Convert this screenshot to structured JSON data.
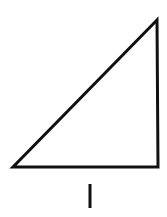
{
  "diagram": {
    "shape": "right-triangle",
    "stroke_color": "#111111",
    "background": "#ffffff",
    "vertices": {
      "top_right": [
        157,
        20
      ],
      "bottom_left": [
        13,
        167
      ],
      "bottom_right": [
        158,
        167
      ]
    },
    "label": "I"
  }
}
